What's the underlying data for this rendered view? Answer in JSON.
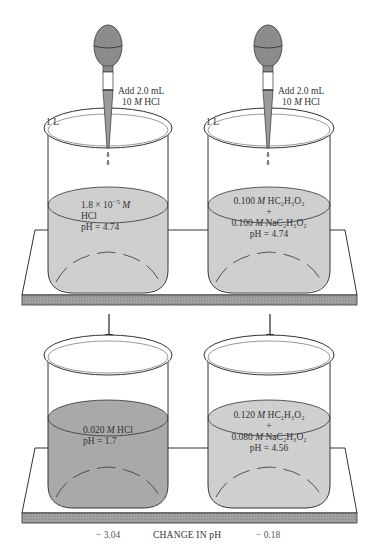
{
  "figure": {
    "type": "buffer-vs-nonbuffer-comparison",
    "colors": {
      "liquid_light": "#cfcfcf",
      "liquid_dark": "#a9a9a9",
      "platform_slab": "#9a9a9a",
      "bulb": "#8a8a8a",
      "outline": "#333333"
    }
  },
  "top_row": {
    "left": {
      "volume_label": "1 L",
      "dropper_label_line1": "Add 2.0 mL",
      "dropper_label_conc": "10",
      "dropper_label_unit": "M",
      "dropper_label_reagent": "HCl",
      "solution": {
        "conc_mantissa": "1.8 × 10",
        "conc_exponent": "−5",
        "conc_unit": "M",
        "solute": "HCl",
        "ph": "pH = 4.74"
      }
    },
    "right": {
      "volume_label": "1 L",
      "dropper_label_line1": "Add 2.0 mL",
      "dropper_label_conc": "10",
      "dropper_label_unit": "M",
      "dropper_label_reagent": "HCl",
      "solution": {
        "acid_conc": "0.100",
        "acid_unit": "M",
        "acid_formula": "HC₂H₃O₂",
        "plus": "+",
        "salt_conc": "0.100",
        "salt_unit": "M",
        "salt_formula": "NaC₂H₃O₂",
        "ph": "pH = 4.74"
      }
    }
  },
  "bottom_row": {
    "left": {
      "solution": {
        "conc": "0.020",
        "unit": "M",
        "solute": "HCl",
        "ph": "pH = 1.7"
      }
    },
    "right": {
      "solution": {
        "acid_conc": "0.120",
        "acid_unit": "M",
        "acid_formula": "HC₂H₃O₂",
        "plus": "+",
        "salt_conc": "0.080",
        "salt_unit": "M",
        "salt_formula": "NaC₂H₃O₂",
        "ph": "pH = 4.56"
      }
    }
  },
  "footer": {
    "left_change": "− 3.04",
    "title": "CHANGE IN pH",
    "right_change": "− 0.18"
  }
}
